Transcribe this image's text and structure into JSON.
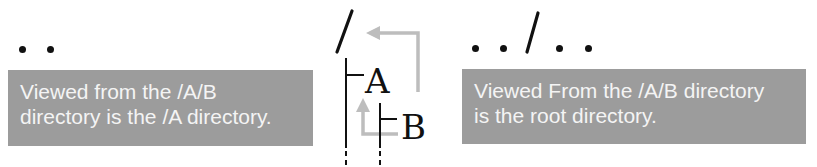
{
  "diagram": {
    "left": {
      "path_label": "..",
      "caption_lines": [
        "Viewed from the /A/B",
        "directory is the /A directory."
      ]
    },
    "center": {
      "root_label": "/",
      "nodes": [
        {
          "label": "A",
          "parent": "/"
        },
        {
          "label": "B",
          "parent": "A"
        }
      ],
      "arrows": [
        {
          "from": "B",
          "to": "A",
          "meaning": ".."
        },
        {
          "from": "B",
          "to": "/",
          "meaning": "../.."
        }
      ]
    },
    "right": {
      "path_label": "../..",
      "caption_lines": [
        "Viewed From the /A/B directory",
        "is the root directory."
      ]
    },
    "colors": {
      "caption_bg": "#9c9c9c",
      "caption_text": "#f4f4f4",
      "arrow": "#bdbdbd",
      "ink": "#111111"
    }
  }
}
